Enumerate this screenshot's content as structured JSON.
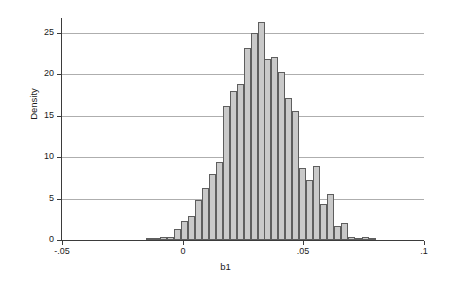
{
  "chart_data": {
    "type": "bar",
    "subtype": "histogram",
    "title": "",
    "xlabel": "b1",
    "ylabel": "Density",
    "xlim": [
      -0.05,
      0.1
    ],
    "ylim": [
      0,
      26.8
    ],
    "xticks": [
      -0.05,
      0,
      0.05,
      0.1
    ],
    "xticklabels": [
      "-.05",
      "0",
      ".05",
      ".1"
    ],
    "yticks": [
      0,
      5,
      10,
      15,
      20,
      25
    ],
    "yticklabels": [
      "0",
      "5",
      "10",
      "15",
      "20",
      "25"
    ],
    "grid": "horizontal",
    "legend": null,
    "bin_width": 0.00288,
    "bin_starts": [
      -0.015,
      -0.0121,
      -0.0092,
      -0.0064,
      -0.0035,
      -0.0006,
      0.0023,
      0.0051,
      0.008,
      0.0109,
      0.0138,
      0.0167,
      0.0195,
      0.0224,
      0.0253,
      0.0282,
      0.0311,
      0.0339,
      0.0368,
      0.0397,
      0.0426,
      0.0455,
      0.0483,
      0.0512,
      0.0541,
      0.057,
      0.0599,
      0.0627,
      0.0656,
      0.0685,
      0.0714,
      0.0743,
      0.0771,
      0.08,
      0.0829,
      0.0858,
      0.0887,
      0.0915
    ],
    "values": [
      0.2,
      0.3,
      0.4,
      0.4,
      1.3,
      2.3,
      2.9,
      4.8,
      6.3,
      8.0,
      9.4,
      16.2,
      18.0,
      18.8,
      23.2,
      25.0,
      26.3,
      21.8,
      22.1,
      20.3,
      17.2,
      15.6,
      8.7,
      7.3,
      8.9,
      4.3,
      5.5,
      1.7,
      2.1,
      0.4,
      0.3,
      0.4,
      0.1,
      0.0,
      0.0,
      0.0,
      0.0,
      0.0
    ],
    "bar_fill_color": "#c9c9c9",
    "bar_border_color": "#5e5e5e",
    "gridline_color": "#aeaeae",
    "axis_color": "#3b3b3b",
    "background_color": "#ffffff"
  }
}
